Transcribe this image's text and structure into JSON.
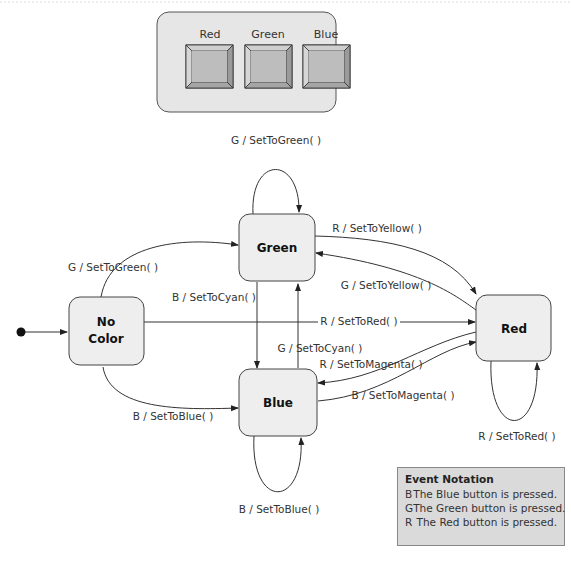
{
  "panel": {
    "buttons": [
      {
        "label": "Red"
      },
      {
        "label": "Green"
      },
      {
        "label": "Blue"
      }
    ]
  },
  "states": {
    "no_color": {
      "line1": "No",
      "line2": "Color"
    },
    "green": {
      "label": "Green"
    },
    "blue": {
      "label": "Blue"
    },
    "red": {
      "label": "Red"
    }
  },
  "transitions": {
    "green_self": "G / SetToGreen( )",
    "nocolor_to_green": "G / SetToGreen( )",
    "green_to_red": "R / SetToYellow( )",
    "red_to_green": "G / SetToYellow( )",
    "green_to_blue": "B / SetToCyan( )",
    "blue_to_green": "G / SetToCyan( )",
    "nocolor_to_red": "R / SetToRed( )",
    "red_to_blue": "R / SetToMagenta( )",
    "blue_to_red": "B / SetToMagenta( )",
    "nocolor_to_blue": "B / SetToBlue( )",
    "blue_self": "B / SetToBlue( )",
    "red_self": "R / SetToRed( )"
  },
  "legend": {
    "title": "Event Notation",
    "items": [
      {
        "key": "B",
        "text": "The Blue button is pressed."
      },
      {
        "key": "G",
        "text": "The Green button is pressed."
      },
      {
        "key": "R",
        "text": "The Red button is pressed."
      }
    ]
  }
}
